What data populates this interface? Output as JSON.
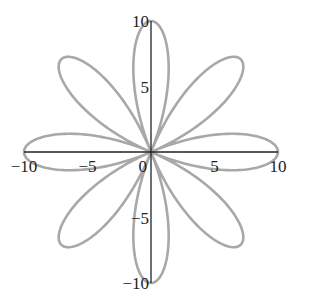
{
  "chart_data": {
    "type": "line",
    "subtype": "polar-rose",
    "title": "",
    "xlabel": "",
    "ylabel": "",
    "equation": "r = 10 cos(4θ)",
    "petals": 8,
    "amplitude": 10,
    "xlim": [
      -10,
      10
    ],
    "ylim": [
      -10,
      10
    ],
    "grid": false,
    "legend": null,
    "x_ticks": [
      {
        "value": -10,
        "label": "−10"
      },
      {
        "value": -5,
        "label": "−5"
      },
      {
        "value": 0,
        "label": "0"
      },
      {
        "value": 5,
        "label": "5"
      },
      {
        "value": 10,
        "label": "10"
      }
    ],
    "y_ticks": [
      {
        "value": 10,
        "label": "10"
      },
      {
        "value": 5,
        "label": "5"
      },
      {
        "value": -5,
        "label": "−5"
      },
      {
        "value": -10,
        "label": "−10"
      }
    ],
    "petal_tip_angles_deg": [
      0,
      45,
      90,
      135,
      180,
      225,
      270,
      315
    ],
    "series": [
      {
        "name": "rose",
        "color": "#a8a8a8",
        "samples": 720
      }
    ]
  },
  "colors": {
    "axis": "#222222",
    "curve": "#a8a8a8",
    "background": "#ffffff"
  }
}
